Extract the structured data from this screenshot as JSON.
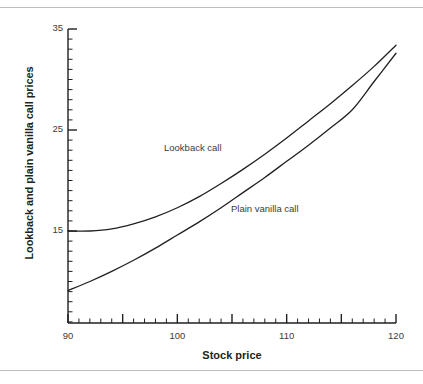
{
  "figure": {
    "background": "#ffffff",
    "rule_color": "#b9bcc0",
    "line_color": "#231f20"
  },
  "axis_titles": {
    "y": "Lookback and plain vanilla call prices",
    "x": "Stock price"
  },
  "y_ticks": [
    {
      "value": 35,
      "label": "35"
    },
    {
      "value": 25,
      "label": "25"
    },
    {
      "value": 15,
      "label": "15"
    }
  ],
  "x_ticks": [
    {
      "value": 90,
      "label": "90"
    },
    {
      "value": 100,
      "label": "100"
    },
    {
      "value": 110,
      "label": "110"
    },
    {
      "value": 120,
      "label": "120"
    }
  ],
  "annotations": [
    {
      "name": "lookback-call-label",
      "text": "Lookback call",
      "x_px": 164,
      "y_px": 142
    },
    {
      "name": "plain-vanilla-call-label",
      "text": "Plain vanilla call",
      "x_px": 231,
      "y_px": 203
    }
  ],
  "chart_data": {
    "type": "line",
    "title": "",
    "xlabel": "Stock price",
    "ylabel": "Lookback and plain vanilla call prices",
    "xlim": [
      90,
      120
    ],
    "ylim": [
      5.9,
      35
    ],
    "grid": false,
    "legend": "inline-annotations",
    "x_major_tick_step": 5,
    "x_minor_tick_step": 1,
    "y_major_tick_step": 10,
    "y_minor_tick_step": 1,
    "x": [
      90,
      92,
      94,
      96,
      98,
      100,
      102,
      104,
      106,
      108,
      110,
      112,
      114,
      116,
      118,
      120
    ],
    "series": [
      {
        "name": "Lookback call",
        "values": [
          15.0,
          15.0,
          15.2,
          15.7,
          16.4,
          17.3,
          18.4,
          19.7,
          21.1,
          22.6,
          24.2,
          25.9,
          27.6,
          29.4,
          31.3,
          33.4
        ]
      },
      {
        "name": "Plain vanilla call",
        "values": [
          9.1,
          10.0,
          11.0,
          12.1,
          13.3,
          14.6,
          15.9,
          17.3,
          18.8,
          20.3,
          21.9,
          23.5,
          25.2,
          27.0,
          29.8,
          32.6
        ]
      }
    ]
  }
}
